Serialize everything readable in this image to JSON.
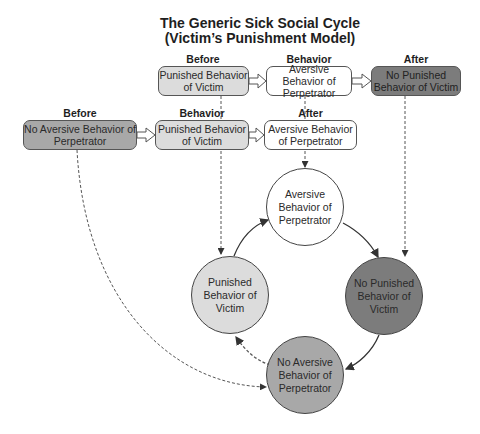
{
  "title": {
    "line1": "The Generic Sick Social Cycle",
    "line2": "(Victim’s Punishment Model)"
  },
  "colors": {
    "light_gray": "#dcdcdc",
    "medium_gray": "#a8a8a8",
    "dark_gray": "#7c7c7c",
    "white": "#ffffff",
    "stroke": "#444444"
  },
  "top_row": {
    "before_label": "Before",
    "before_box": "Punished Behavior of Victim",
    "behavior_label": "Behavior",
    "behavior_box": "Aversive Behavior of Perpetrator",
    "after_label": "After",
    "after_box": "No Punished Behavior of Victim"
  },
  "bottom_row": {
    "before_label": "Before",
    "before_box": "No Aversive Behavior of Perpetrator",
    "behavior_label": "Behavior",
    "behavior_box": "Punished Behavior of Victim",
    "after_label": "After",
    "after_box": "Aversive Behavior of Perpetrator"
  },
  "cycle": {
    "top": "Aversive Behavior of Perpetrator",
    "right": "No Punished Behavior of Victim",
    "bottom": "No Aversive Behavior of Perpetrator",
    "left": "Punished Behavior of Victim"
  }
}
